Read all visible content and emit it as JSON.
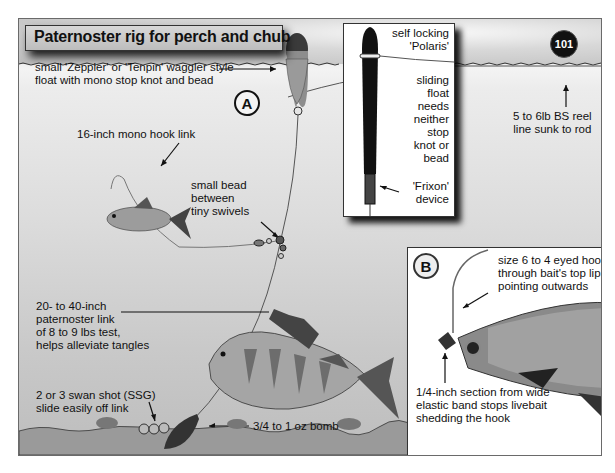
{
  "title": "Paternoster rig for perch and chub",
  "page_number": "101",
  "markers": {
    "a": "A",
    "b": "B"
  },
  "labels": {
    "float": [
      "small 'Zeppler' or 'Tenpin' waggler style",
      "float with mono stop knot and bead"
    ],
    "reel_line": [
      "5 to 6lb BS reel",
      "line sunk to rod"
    ],
    "hook_link": "16-inch mono hook link",
    "bead": [
      "small bead",
      "between",
      "tiny swivels"
    ],
    "paternoster": [
      "20- to 40-inch",
      "paternoster link",
      "of 8 to 9 lbs test,",
      "helps alleviate tangles"
    ],
    "swan_shot": [
      "2 or 3 swan shot (SSG)",
      "slide easily off link"
    ],
    "bomb": "3/4 to 1 oz bomb"
  },
  "inset_float": {
    "polaris": [
      "self locking",
      "'Polaris'"
    ],
    "sliding": [
      "sliding",
      "float",
      "needs",
      "neither",
      "stop",
      "knot or",
      "bead"
    ],
    "frixon": [
      "'Frixon'",
      "device"
    ]
  },
  "inset_hook": {
    "hook": [
      "size 6 to 4 eyed hook",
      "through bait's top lip",
      "pointing outwards"
    ],
    "elastic": [
      "1/4-inch section from wide",
      "elastic band stops livebait",
      "shedding the hook"
    ]
  }
}
